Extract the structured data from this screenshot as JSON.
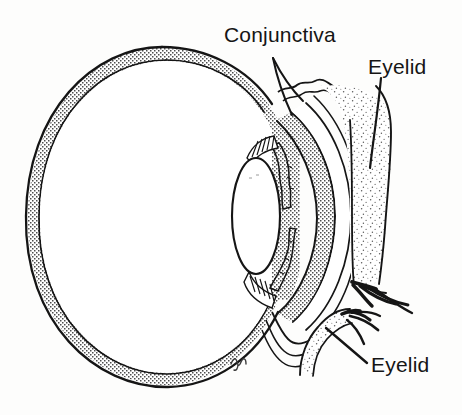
{
  "figure": {
    "style": "black-and-white stippled line drawing",
    "background_color": "#fdfdfc",
    "ink_color": "#151515",
    "stipple_color": "#5a5a5a",
    "width": 462,
    "height": 415
  },
  "labels": {
    "conjunctiva": {
      "text": "Conjunctiva",
      "leader": "double-line-wedge-down-right"
    },
    "eyelid_upper": {
      "text": "Eyelid",
      "leader": "vertical-line-down"
    },
    "eyelid_lower": {
      "text": "Eyelid",
      "leader": "diagonal-line-up-left"
    }
  },
  "structures": {
    "sclera": {
      "name": "sclera-wall",
      "fill": "stipple",
      "outline": "#151515"
    },
    "vitreous": {
      "name": "vitreous-body",
      "fill": "#ffffff"
    },
    "lens": {
      "name": "lens",
      "fill": "#ffffff",
      "center_x": 256,
      "center_y": 216,
      "radius_x": 24,
      "radius_y": 58
    },
    "iris_upper": {
      "name": "iris-upper-leaf",
      "fill": "stipple"
    },
    "iris_lower": {
      "name": "iris-lower-leaf",
      "fill": "stipple"
    },
    "zonule_upper": {
      "name": "zonular-fibers-upper",
      "fill": "hatching"
    },
    "zonule_lower": {
      "name": "zonular-fibers-lower",
      "fill": "hatching"
    },
    "cornea": {
      "name": "cornea",
      "fill": "stipple"
    },
    "conjunctival_sac": {
      "name": "conjunctival-sac",
      "fill": "#ffffff"
    },
    "eyelid_upper": {
      "name": "upper-eyelid",
      "fill": "sparse-stipple"
    },
    "eyelid_lower": {
      "name": "lower-eyelid",
      "fill": "sparse-stipple"
    },
    "lashes_upper": {
      "name": "upper-eyelashes",
      "count": 4
    },
    "lashes_lower": {
      "name": "lower-eyelashes",
      "count": 4
    },
    "signature": {
      "name": "artist-monogram",
      "text": "℘"
    }
  }
}
